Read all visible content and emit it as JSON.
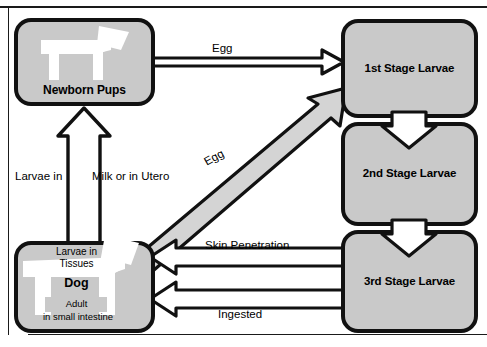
{
  "diagram": {
    "colors": {
      "node_fill": "#c9c9c9",
      "outline": "#111111",
      "arrow_fill": "#ffffff",
      "background": "#ffffff"
    },
    "nodes": [
      {
        "id": "newborn-pups",
        "label": "Newborn Pups",
        "icon": "dog-silhouette-icon"
      },
      {
        "id": "first-stage",
        "label": "1st Stage Larvae",
        "icon": null
      },
      {
        "id": "second-stage",
        "label": "2nd Stage Larvae",
        "icon": null
      },
      {
        "id": "third-stage",
        "label": "3rd Stage Larvae",
        "icon": null
      },
      {
        "id": "dog",
        "label": "Dog",
        "icon": "dog-silhouette-icon"
      }
    ],
    "dog_box_text": {
      "larvae_line1": "Larvae in",
      "larvae_line2": "Tissues",
      "name": "Dog",
      "adult": "Adult",
      "location": "in small intestine"
    },
    "edges": [
      {
        "id": "egg-top",
        "label": "Egg",
        "from": "newborn-pups",
        "to": "first-stage",
        "direction": "right"
      },
      {
        "id": "egg-diagonal",
        "label": "Egg",
        "from": "dog",
        "to": "first-stage",
        "direction": "up-right"
      },
      {
        "id": "larvae-milk",
        "label": "Larvae in",
        "from": "dog",
        "to": "newborn-pups",
        "direction": "up"
      },
      {
        "id": "milk-utero",
        "label": "Milk or in Utero",
        "from": "dog",
        "to": "newborn-pups",
        "direction": "up"
      },
      {
        "id": "skin-pen",
        "label": "Skin Penetration",
        "from": "third-stage",
        "to": "dog",
        "direction": "left"
      },
      {
        "id": "ingested",
        "label": "Ingested",
        "from": "third-stage",
        "to": "dog",
        "direction": "left"
      },
      {
        "id": "l1-to-l2",
        "label": "",
        "from": "first-stage",
        "to": "second-stage",
        "direction": "down"
      },
      {
        "id": "l2-to-l3",
        "label": "",
        "from": "second-stage",
        "to": "third-stage",
        "direction": "down"
      }
    ]
  }
}
